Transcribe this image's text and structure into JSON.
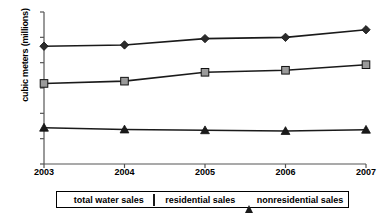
{
  "chart_data": {
    "type": "line",
    "title": "",
    "xlabel": "",
    "ylabel": "cubic meters (millions)",
    "categories": [
      "2003",
      "2004",
      "2005",
      "2006",
      "2007"
    ],
    "x": [
      2003,
      2004,
      2005,
      2006,
      2007
    ],
    "xlim": [
      2003,
      2007
    ],
    "ylim": [
      0,
      60
    ],
    "yticks": [
      0,
      10,
      20,
      30,
      40,
      50,
      60
    ],
    "grid": false,
    "legend_position": "bottom",
    "series": [
      {
        "name": "total water sales",
        "marker": "diamond",
        "color": "#2b2b2b",
        "values": [
          46.5,
          47.0,
          49.5,
          50.0,
          53.0
        ]
      },
      {
        "name": "residential sales",
        "marker": "square",
        "color": "#9a9a9a",
        "values": [
          31.8,
          32.7,
          36.2,
          37.0,
          39.2
        ]
      },
      {
        "name": "nonresidential sales",
        "marker": "triangle",
        "color": "#1a1a1a",
        "values": [
          14.3,
          13.6,
          13.3,
          13.0,
          13.5
        ]
      }
    ]
  },
  "axis": {
    "y_title": "cubic meters (millions)",
    "y_tick_labels": [
      "60",
      "50",
      "40",
      "30",
      "20",
      "10",
      "0"
    ],
    "x_tick_labels": [
      "2003",
      "2004",
      "2005",
      "2006",
      "2007"
    ]
  },
  "legend": {
    "entries": [
      {
        "label": "total water sales",
        "marker": "diamond-marker-icon"
      },
      {
        "label": "residential sales",
        "marker": "square-marker-icon"
      },
      {
        "label": "nonresidential sales",
        "marker": "triangle-marker-icon"
      }
    ]
  }
}
